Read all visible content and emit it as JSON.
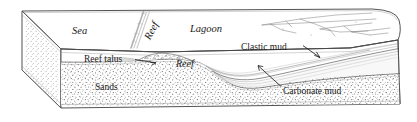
{
  "figure": {
    "type": "geological-block-diagram",
    "background_color": "#ffffff",
    "line_color": "#3a3a3a",
    "text_color": "#1a1a1a",
    "stipple_color": "#6e6e6e"
  },
  "surface_labels": {
    "sea": "Sea",
    "reef_top": "Reef",
    "lagoon": "Lagoon"
  },
  "section_labels": {
    "reef_talus": "Reef talus",
    "reef_section": "Reef",
    "sands": "Sands",
    "clastic_mud": "Clastic mud",
    "carbonate_mud": "Carbonate mud"
  },
  "units": [
    {
      "name": "Sands",
      "pattern": "stipple",
      "label": "Sands"
    },
    {
      "name": "Reef",
      "pattern": "rubble",
      "label": "Reef"
    },
    {
      "name": "Reef talus",
      "pattern": "fine-stipple",
      "label": "Reef talus"
    },
    {
      "name": "Carbonate mud",
      "pattern": "laminated",
      "label": "Carbonate mud"
    },
    {
      "name": "Clastic mud",
      "pattern": "laminated",
      "label": "Clastic mud"
    }
  ],
  "leaders": [
    {
      "label": "Reef talus",
      "from": [
        136,
        58
      ],
      "to": [
        158,
        63
      ]
    },
    {
      "label": "Clastic mud",
      "from": [
        303,
        46
      ],
      "to": [
        320,
        58
      ]
    },
    {
      "label": "Carbonate mud",
      "from": [
        282,
        87
      ],
      "to": [
        258,
        66
      ]
    }
  ]
}
